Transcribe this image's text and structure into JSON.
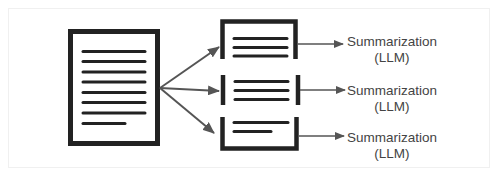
{
  "diagram": {
    "colors": {
      "stroke": "#222222",
      "arrow": "#555555",
      "text": "#444444",
      "background": "#ffffff",
      "frame": "#f0f0f0"
    },
    "source_document": {
      "icon": "document-icon",
      "text_lines": 8
    },
    "chunks": [
      {
        "icon": "chunk-top-icon",
        "text_lines": 3,
        "label_line1": "Summarization",
        "label_line2": "(LLM)"
      },
      {
        "icon": "chunk-middle-icon",
        "text_lines": 3,
        "label_line1": "Summarization",
        "label_line2": "(LLM)"
      },
      {
        "icon": "chunk-bottom-icon",
        "text_lines": 2,
        "label_line1": "Summarization",
        "label_line2": "(LLM)"
      }
    ]
  }
}
